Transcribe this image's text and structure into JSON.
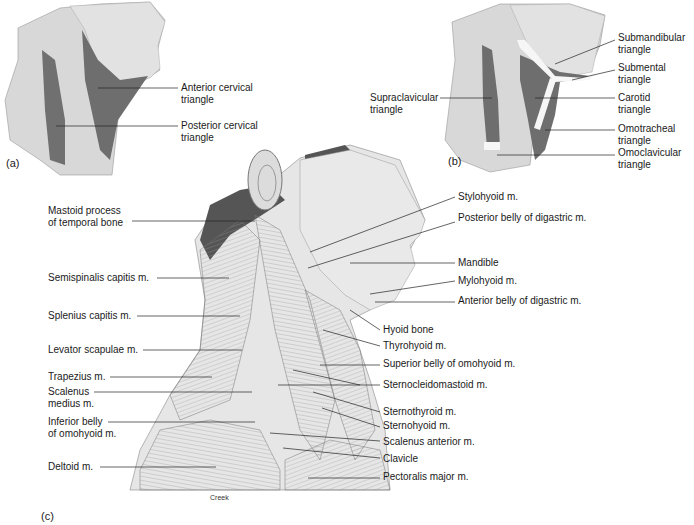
{
  "figure": {
    "panels": {
      "a": {
        "letter": "(a)",
        "labels": {
          "anterior_cervical_triangle": "Anterior cervical\ntriangle",
          "posterior_cervical_triangle": "Posterior cervical\ntriangle"
        }
      },
      "b": {
        "letter": "(b)",
        "labels": {
          "supraclavicular_triangle": "Supraclavicular\ntriangle",
          "submandibular_triangle": "Submandibular\ntriangle",
          "submental_triangle": "Submental\ntriangle",
          "carotid_triangle": "Carotid\ntriangle",
          "omotracheal_triangle": "Omotracheal\ntriangle",
          "omoclavicular_triangle": "Omoclavicular\ntriangle"
        }
      },
      "c": {
        "letter": "(c)",
        "credit": "Creek",
        "left_labels": {
          "mastoid_process": "Mastoid process\nof temporal bone",
          "semispinalis_capitis": "Semispinalis capitis m.",
          "splenius_capitis": "Splenius capitis m.",
          "levator_scapulae": "Levator scapulae m.",
          "trapezius": "Trapezius m.",
          "scalenus_medius": "Scalenus\nmedius m.",
          "inferior_belly_omohyoid": "Inferior belly\nof omohyoid m.",
          "deltoid": "Deltoid m."
        },
        "right_labels": {
          "stylohyoid": "Stylohyoid m.",
          "posterior_belly_digastric": "Posterior belly of digastric m.",
          "mandible": "Mandible",
          "mylohyoid": "Mylohyoid m.",
          "anterior_belly_digastric": "Anterior belly of digastric m.",
          "hyoid_bone": "Hyoid bone",
          "thyrohyoid": "Thyrohyoid m.",
          "superior_belly_omohyoid": "Superior belly of omohyoid m.",
          "sternocleidomastoid": "Sternocleidomastoid m.",
          "sternothyroid": "Sternothyroid m.",
          "sternohyoid": "Sternohyoid m.",
          "scalenus_anterior": "Scalenus anterior m.",
          "clavicle": "Clavicle",
          "pectoralis_major": "Pectoralis major m."
        }
      }
    },
    "colors": {
      "skin": "#d9d9d9",
      "triangle_dark": "#6e6e6e",
      "muscle": "#c8c8c8",
      "leader": "#222222"
    }
  }
}
